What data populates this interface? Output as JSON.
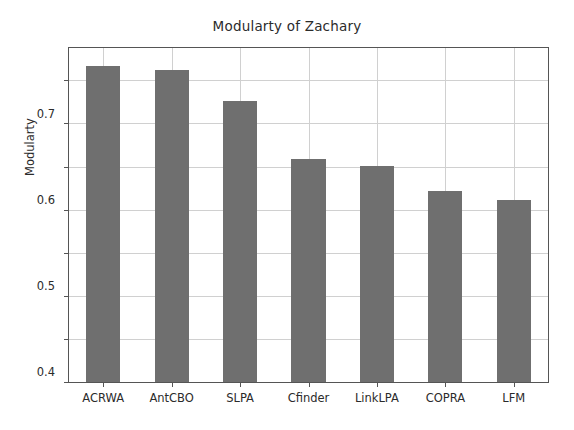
{
  "chart_data": {
    "type": "bar",
    "title": "Modularty of Zachary",
    "xlabel": "",
    "ylabel": "Modularty",
    "categories": [
      "ACRWA",
      "AntCBO",
      "SLPA",
      "Cfinder",
      "LinkLPA",
      "COPRA",
      "LFM"
    ],
    "values": [
      0.734,
      0.724,
      0.653,
      0.518,
      0.502,
      0.444,
      0.422
    ],
    "ylim": [
      0.0,
      0.775
    ],
    "yticks": [
      0.0,
      0.1,
      0.2,
      0.3,
      0.4,
      0.5,
      0.6,
      0.7
    ],
    "ytick_labels": [
      "0.0",
      "0.1",
      "0.2",
      "0.3",
      "0.4",
      "0.5",
      "0.6",
      "0.7"
    ],
    "grid": true,
    "legend": false,
    "bar_color": "#6f6f6f",
    "axis_color": "#555555",
    "grid_color": "#d0d0d0",
    "background_color": "#ffffff"
  }
}
